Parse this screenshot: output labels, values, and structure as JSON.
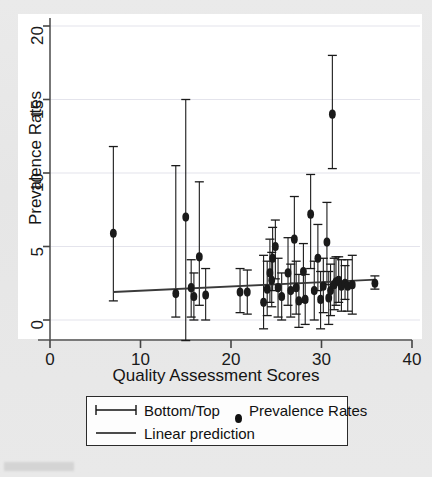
{
  "chart_data": {
    "type": "scatter",
    "title": "",
    "xlabel": "Quality Assessment Scores",
    "ylabel": "Prevalence Rates",
    "xlim": [
      0,
      40
    ],
    "ylim": [
      0,
      20
    ],
    "xticks": [
      0,
      10,
      20,
      30,
      40
    ],
    "yticks": [
      0,
      5,
      10,
      15,
      20
    ],
    "grid": true,
    "grid_axis": "y",
    "legend_position": "below-plot",
    "legend": [
      {
        "label": "Bottom/Top",
        "marker": "error-bar-capped"
      },
      {
        "label": "Prevalence Rates",
        "marker": "filled-circle"
      },
      {
        "label": "Linear prediction",
        "marker": "line"
      }
    ],
    "series": [
      {
        "name": "Prevalence Rates",
        "marker": "filled-circle",
        "color": "#1a1a1a",
        "error_bar_name": "Bottom/Top",
        "points": [
          {
            "x": 7.0,
            "y": 5.9,
            "lo": 1.3,
            "hi": 11.8
          },
          {
            "x": 13.9,
            "y": 1.8,
            "lo": 0.2,
            "hi": 10.5
          },
          {
            "x": 15.0,
            "y": 7.0,
            "lo": -1.4,
            "hi": 15.0
          },
          {
            "x": 15.6,
            "y": 2.2,
            "lo": 0.2,
            "hi": 4.1
          },
          {
            "x": 15.9,
            "y": 1.6,
            "lo": 0.0,
            "hi": 3.2
          },
          {
            "x": 16.5,
            "y": 4.3,
            "lo": 1.0,
            "hi": 9.4
          },
          {
            "x": 17.2,
            "y": 1.7,
            "lo": 0.0,
            "hi": 3.5
          },
          {
            "x": 21.0,
            "y": 1.9,
            "lo": 0.5,
            "hi": 3.5
          },
          {
            "x": 21.8,
            "y": 1.9,
            "lo": 0.4,
            "hi": 3.4
          },
          {
            "x": 23.6,
            "y": 1.2,
            "lo": -0.6,
            "hi": 4.4
          },
          {
            "x": 24.0,
            "y": 2.1,
            "lo": 0.3,
            "hi": 4.0
          },
          {
            "x": 24.3,
            "y": 3.2,
            "lo": 1.2,
            "hi": 5.5
          },
          {
            "x": 24.5,
            "y": 2.7,
            "lo": 0.9,
            "hi": 4.6
          },
          {
            "x": 24.6,
            "y": 4.2,
            "lo": 2.0,
            "hi": 6.3
          },
          {
            "x": 24.9,
            "y": 5.0,
            "lo": 2.8,
            "hi": 6.8
          },
          {
            "x": 25.2,
            "y": 2.2,
            "lo": 0.2,
            "hi": 4.2
          },
          {
            "x": 25.6,
            "y": 1.6,
            "lo": 0.0,
            "hi": 3.2
          },
          {
            "x": 26.3,
            "y": 3.2,
            "lo": 1.0,
            "hi": 5.6
          },
          {
            "x": 26.6,
            "y": 2.0,
            "lo": 0.2,
            "hi": 3.8
          },
          {
            "x": 27.0,
            "y": 5.5,
            "lo": 2.5,
            "hi": 8.4
          },
          {
            "x": 27.2,
            "y": 2.2,
            "lo": 0.4,
            "hi": 4.0
          },
          {
            "x": 27.5,
            "y": 1.3,
            "lo": -0.5,
            "hi": 3.1
          },
          {
            "x": 28.0,
            "y": 3.3,
            "lo": 1.2,
            "hi": 5.2
          },
          {
            "x": 28.2,
            "y": 1.4,
            "lo": -0.3,
            "hi": 3.1
          },
          {
            "x": 28.8,
            "y": 7.2,
            "lo": 3.5,
            "hi": 9.9
          },
          {
            "x": 29.2,
            "y": 2.0,
            "lo": 0.0,
            "hi": 4.0
          },
          {
            "x": 29.6,
            "y": 4.2,
            "lo": 2.0,
            "hi": 6.5
          },
          {
            "x": 29.9,
            "y": 1.4,
            "lo": -0.6,
            "hi": 3.3
          },
          {
            "x": 30.2,
            "y": 2.3,
            "lo": 0.5,
            "hi": 4.2
          },
          {
            "x": 30.6,
            "y": 5.3,
            "lo": 2.4,
            "hi": 8.0
          },
          {
            "x": 30.8,
            "y": 1.5,
            "lo": -0.3,
            "hi": 3.3
          },
          {
            "x": 31.0,
            "y": 2.0,
            "lo": 0.3,
            "hi": 3.8
          },
          {
            "x": 31.2,
            "y": 14.0,
            "lo": 10.3,
            "hi": 18.0
          },
          {
            "x": 31.4,
            "y": 2.4,
            "lo": 0.7,
            "hi": 4.2
          },
          {
            "x": 31.6,
            "y": 2.6,
            "lo": 1.0,
            "hi": 4.3
          },
          {
            "x": 31.9,
            "y": 2.7,
            "lo": 1.2,
            "hi": 4.3
          },
          {
            "x": 32.2,
            "y": 2.3,
            "lo": 0.6,
            "hi": 4.1
          },
          {
            "x": 32.6,
            "y": 2.5,
            "lo": 1.4,
            "hi": 3.7
          },
          {
            "x": 32.9,
            "y": 2.3,
            "lo": 0.6,
            "hi": 4.1
          },
          {
            "x": 33.4,
            "y": 2.4,
            "lo": 0.4,
            "hi": 4.4
          },
          {
            "x": 35.9,
            "y": 2.5,
            "lo": 2.1,
            "hi": 3.0
          }
        ]
      }
    ],
    "linear_prediction": {
      "name": "Linear prediction",
      "x0": 7.0,
      "y0": 1.9,
      "x1": 36.0,
      "y1": 2.75,
      "color": "#3a3a3a"
    }
  }
}
